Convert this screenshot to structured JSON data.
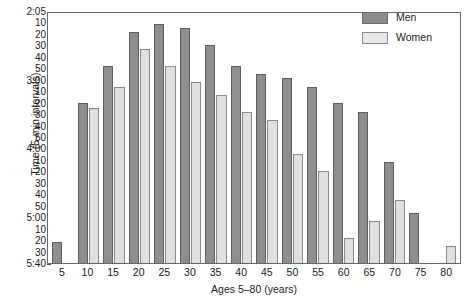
{
  "chart_data": {
    "type": "bar",
    "title": "",
    "xlabel": "Ages 5–80 (years)",
    "ylabel": "Time (5-min intervals)",
    "categories": [
      "5",
      "10",
      "15",
      "20",
      "25",
      "30",
      "35",
      "40",
      "45",
      "50",
      "55",
      "60",
      "65",
      "70",
      "75",
      "80"
    ],
    "xtick_labels": [
      "5",
      "10",
      "15",
      "20",
      "25",
      "30",
      "35",
      "40",
      "45",
      "50",
      "55",
      "60",
      "65",
      "70",
      "75",
      "80"
    ],
    "ytick_labels": [
      "2:05",
      "10",
      "20",
      "30",
      "40",
      "50",
      "3:00",
      "10",
      "20",
      "30",
      "40",
      "50",
      "4:00",
      "10",
      "20",
      "30",
      "40",
      "50",
      "5:00",
      "10",
      "20",
      "30",
      "5:40"
    ],
    "ylim_top_label": "2:05",
    "ylim_bottom_label": "5:40",
    "y_axis_direction": "descending",
    "grid": false,
    "legend_position": "top-right",
    "legend": [
      "Men",
      "Women"
    ],
    "colors": {
      "men": "#8e8e8e",
      "women": "#e0e0e0",
      "edge": "#5e5e5e",
      "axis": "#666666"
    },
    "series": [
      {
        "name": "Men",
        "values": [
          5,
          38,
          47,
          55,
          57,
          56,
          52,
          47,
          45,
          44,
          42,
          38,
          36,
          24,
          12,
          0
        ]
      },
      {
        "name": "Women",
        "values": [
          0,
          37,
          42,
          51,
          47,
          43,
          40,
          36,
          34,
          26,
          22,
          6,
          10,
          15,
          0,
          4
        ]
      }
    ],
    "units_note": "values are minutes measured downward from 2:05 on a descending clock-time axis"
  },
  "legend": {
    "men_label": "Men",
    "women_label": "Women"
  },
  "axes": {
    "x_title": "Ages 5–80 (years)",
    "y_title": "Time (5-min intervals)"
  }
}
